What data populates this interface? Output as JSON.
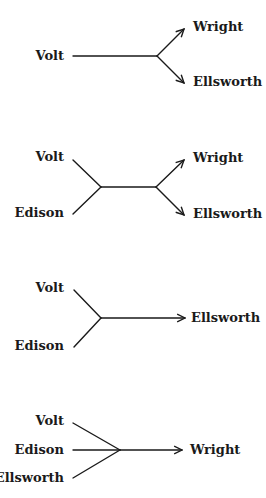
{
  "diagrams": [
    {
      "id": "d1",
      "left_labels": [
        {
          "text": "Volt",
          "x": 64,
          "y": 60
        }
      ],
      "right_labels": [
        {
          "text": "Wright",
          "x": 193,
          "y": 31
        },
        {
          "text": "Ellsworth",
          "x": 193,
          "y": 86
        }
      ]
    },
    {
      "id": "d2",
      "left_labels": [
        {
          "text": "Volt",
          "x": 64,
          "y": 161
        },
        {
          "text": "Edison",
          "x": 64,
          "y": 217
        }
      ],
      "right_labels": [
        {
          "text": "Wright",
          "x": 193,
          "y": 162
        },
        {
          "text": "Ellsworth",
          "x": 193,
          "y": 218
        }
      ]
    },
    {
      "id": "d3",
      "left_labels": [
        {
          "text": "Volt",
          "x": 64,
          "y": 292
        },
        {
          "text": "Edison",
          "x": 64,
          "y": 350
        }
      ],
      "right_labels": [
        {
          "text": "Ellsworth",
          "x": 191,
          "y": 322
        }
      ]
    },
    {
      "id": "d4",
      "left_labels": [
        {
          "text": "Volt",
          "x": 64,
          "y": 425
        },
        {
          "text": "Edison",
          "x": 64,
          "y": 454
        },
        {
          "text": "Ellsworth",
          "x": 64,
          "y": 482
        }
      ],
      "right_labels": [
        {
          "text": "Wright",
          "x": 190,
          "y": 454
        }
      ]
    }
  ]
}
